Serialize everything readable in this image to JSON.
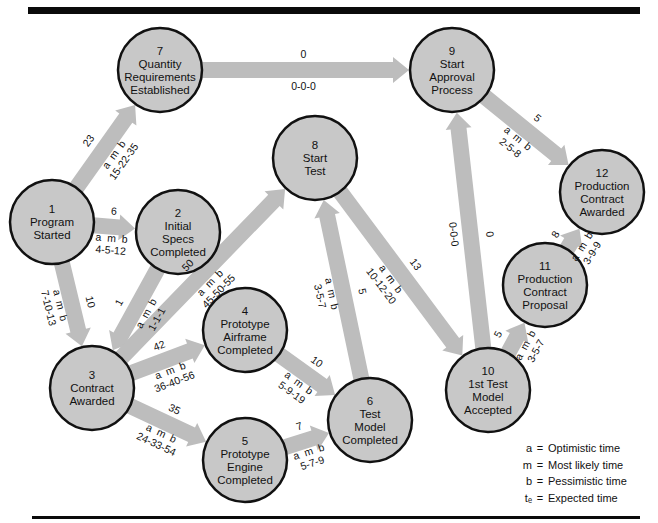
{
  "caption": "FIGURE 12.11  Expected times in a PERT network",
  "nodes": [
    {
      "id": "1",
      "number": "1",
      "lines": [
        "Program",
        "Started"
      ],
      "cx": 52,
      "cy": 222
    },
    {
      "id": "2",
      "number": "2",
      "lines": [
        "Initial",
        "Specs",
        "Completed"
      ],
      "cx": 178,
      "cy": 232
    },
    {
      "id": "3",
      "number": "3",
      "lines": [
        "Contract",
        "Awarded"
      ],
      "cx": 92,
      "cy": 388
    },
    {
      "id": "4",
      "number": "4",
      "lines": [
        "Prototype",
        "Airframe",
        "Completed"
      ],
      "cx": 245,
      "cy": 330
    },
    {
      "id": "5",
      "number": "5",
      "lines": [
        "Prototype",
        "Engine",
        "Completed"
      ],
      "cx": 245,
      "cy": 460
    },
    {
      "id": "6",
      "number": "6",
      "lines": [
        "Test",
        "Model",
        "Completed"
      ],
      "cx": 370,
      "cy": 420
    },
    {
      "id": "7",
      "number": "7",
      "lines": [
        "Quantity",
        "Requirements",
        "Established"
      ],
      "cx": 160,
      "cy": 70
    },
    {
      "id": "8",
      "number": "8",
      "lines": [
        "Start",
        "Test"
      ],
      "cx": 315,
      "cy": 158
    },
    {
      "id": "9",
      "number": "9",
      "lines": [
        "Start",
        "Approval",
        "Process"
      ],
      "cx": 452,
      "cy": 70
    },
    {
      "id": "10",
      "number": "10",
      "lines": [
        "1st Test",
        "Model",
        "Accepted"
      ],
      "cx": 488,
      "cy": 390
    },
    {
      "id": "11",
      "number": "11",
      "lines": [
        "Production",
        "Contract",
        "Proposal"
      ],
      "cx": 545,
      "cy": 285
    },
    {
      "id": "12",
      "number": "12",
      "lines": [
        "Production",
        "Contract",
        "Awarded"
      ],
      "cx": 602,
      "cy": 192
    }
  ],
  "edges": [
    {
      "from": "1",
      "to": "7",
      "te": "23",
      "amb": "15-22-35"
    },
    {
      "from": "1",
      "to": "2",
      "te": "6",
      "amb": "4-5-12"
    },
    {
      "from": "1",
      "to": "3",
      "te": "10",
      "amb": "7-10-13"
    },
    {
      "from": "2",
      "to": "3",
      "te": "1",
      "amb": "1-1-1"
    },
    {
      "from": "3",
      "to": "8",
      "te": "50",
      "amb": "45-50-55"
    },
    {
      "from": "3",
      "to": "4",
      "te": "42",
      "amb": "36-40-56"
    },
    {
      "from": "3",
      "to": "5",
      "te": "35",
      "amb": "24-33-54"
    },
    {
      "from": "4",
      "to": "6",
      "te": "10",
      "amb": "5-9-19"
    },
    {
      "from": "5",
      "to": "6",
      "te": "7",
      "amb": "5-7-9"
    },
    {
      "from": "6",
      "to": "8",
      "te": "5",
      "amb": "3-5-7"
    },
    {
      "from": "8",
      "to": "10",
      "te": "13",
      "amb": "10-12-20"
    },
    {
      "from": "7",
      "to": "9",
      "te": "0",
      "amb": "0-0-0"
    },
    {
      "from": "10",
      "to": "9",
      "te": "0",
      "amb": "0-0-0"
    },
    {
      "from": "9",
      "to": "12",
      "te": "5",
      "amb": "2-5-8"
    },
    {
      "from": "10",
      "to": "11",
      "te": "5",
      "amb": "3-5-7"
    },
    {
      "from": "11",
      "to": "12",
      "te": "8",
      "amb": "3-9-9"
    }
  ],
  "amb_header": "a  m  b",
  "legend": [
    {
      "key": "a",
      "text": "Optimistic time"
    },
    {
      "key": "m",
      "text": "Most likely time"
    },
    {
      "key": "b",
      "text": "Pessimistic time"
    },
    {
      "key": "tₑ",
      "text": "Expected time"
    }
  ],
  "colors": {
    "node_fill": "#c8c8c8",
    "arrow_fill": "#bdbdbd",
    "stroke": "#111111"
  }
}
